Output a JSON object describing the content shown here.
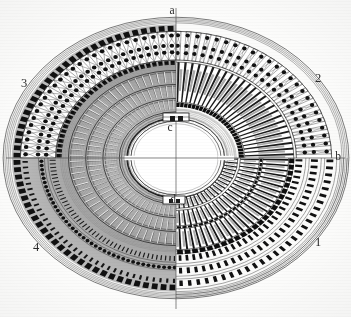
{
  "figure": {
    "kind": "architectural-plan",
    "background_color": "#fdfdfc",
    "ink_color": "#1a1a1a",
    "shading_color": "#9a9a9a"
  },
  "axis_labels": [
    {
      "id": "a",
      "text": "a",
      "x": 172,
      "y": 11,
      "role": "major-axis-top"
    },
    {
      "id": "b",
      "text": "b",
      "x": 338,
      "y": 157,
      "role": "minor-axis-right"
    },
    {
      "id": "c",
      "text": "c",
      "x": 170,
      "y": 128,
      "role": "arena-north-structure"
    },
    {
      "id": "d",
      "text": "d",
      "x": 172,
      "y": 200,
      "role": "arena-south-structure"
    }
  ],
  "quadrant_labels": [
    {
      "id": "1",
      "text": "1",
      "x": 318,
      "y": 243,
      "quadrant": "lower-right"
    },
    {
      "id": "2",
      "text": "2",
      "x": 318,
      "y": 79,
      "quadrant": "upper-right"
    },
    {
      "id": "3",
      "text": "3",
      "x": 24,
      "y": 84,
      "quadrant": "upper-left"
    },
    {
      "id": "4",
      "text": "4",
      "x": 36,
      "y": 248,
      "quadrant": "lower-left"
    }
  ],
  "geometry": {
    "center": {
      "x": 176,
      "y": 158
    },
    "outer_ellipse": {
      "rx": 172,
      "ry": 140
    },
    "arena_ellipse": {
      "rx": 60,
      "ry": 44
    },
    "ring_count": 9,
    "radial_bay_count": 80
  },
  "rings": [
    {
      "name": "outer-cornice",
      "r": 1.0,
      "style": "thin-line"
    },
    {
      "name": "outer-arcade-piers",
      "r": 0.94,
      "style": "pier-blocks"
    },
    {
      "name": "second-arcade",
      "r": 0.86,
      "style": "pier-blocks"
    },
    {
      "name": "third-arcade",
      "r": 0.78,
      "style": "pier-blocks"
    },
    {
      "name": "ambulatory-vaults",
      "r": 0.7,
      "style": "cross-vault"
    },
    {
      "name": "upper-cavea",
      "r": 0.6,
      "style": "seating-tiers"
    },
    {
      "name": "radial-walls",
      "r": 0.48,
      "style": "radial-walls"
    },
    {
      "name": "lower-cavea",
      "r": 0.36,
      "style": "seating-tiers"
    },
    {
      "name": "podium-wall",
      "r": 0.27,
      "style": "heavy-line"
    }
  ],
  "structures": [
    {
      "name": "pulvinar-north",
      "label": "c",
      "position": "top-of-arena"
    },
    {
      "name": "pulvinar-south",
      "label": "d",
      "position": "bottom-of-arena"
    }
  ],
  "axes": {
    "major_axis": {
      "from": "a",
      "to": "bottom",
      "orientation": "vertical"
    },
    "minor_axis": {
      "from": "left",
      "to": "b",
      "orientation": "horizontal"
    }
  }
}
